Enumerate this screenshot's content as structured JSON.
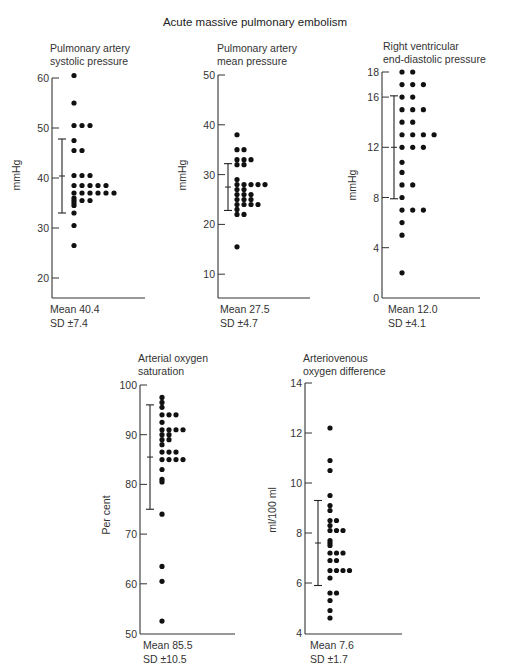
{
  "title": "Acute massive pulmonary embolism",
  "chart_data": [
    {
      "type": "scatter",
      "subtype": "dot-strip",
      "title": "Pulmonary artery systolic pressure",
      "title_lines": [
        "Pulmonary artery",
        "systolic pressure"
      ],
      "ylabel": "mmHg",
      "yticks": [
        20,
        30,
        40,
        50,
        60
      ],
      "ylim": [
        15.5,
        60
      ],
      "values": [
        60.5,
        55,
        50.5,
        50.5,
        50.5,
        47.5,
        45.5,
        45.5,
        40.5,
        40.5,
        40.5,
        38.5,
        38.5,
        38.5,
        38.5,
        38.5,
        37,
        37,
        37,
        37,
        37,
        37,
        36,
        35.5,
        35.5,
        35.5,
        35,
        34.5,
        33,
        30.5,
        26.5
      ],
      "mean": 40.4,
      "sd": 7.4,
      "mean_label": "Mean 40.4",
      "sd_label": "SD ±7.4"
    },
    {
      "type": "scatter",
      "subtype": "dot-strip",
      "title": "Pulmonary artery mean pressure",
      "title_lines": [
        "Pulmonary artery",
        "mean pressure"
      ],
      "ylabel": "mmHg",
      "yticks": [
        10,
        20,
        30,
        40,
        50
      ],
      "ylim": [
        5,
        50
      ],
      "values": [
        38,
        35,
        35,
        33,
        33,
        33,
        32,
        32,
        29,
        28,
        28,
        28,
        28,
        28,
        27,
        27,
        26,
        26,
        26,
        25,
        25,
        25,
        24,
        24,
        24,
        24,
        23,
        22,
        22,
        15.5
      ],
      "mean": 27.5,
      "sd": 4.7,
      "mean_label": "Mean 27.5",
      "sd_label": "SD ±4.7"
    },
    {
      "type": "scatter",
      "subtype": "dot-strip",
      "title": "Right ventricular end-diastolic pressure",
      "title_lines": [
        "Right ventricular",
        "end-diastolic pressure"
      ],
      "ylabel": "mmHg",
      "yticks": [
        0,
        4,
        8,
        12,
        16,
        18
      ],
      "ylim": [
        0,
        18
      ],
      "values": [
        18,
        18,
        17,
        17,
        17,
        16,
        16,
        15,
        15,
        15,
        14,
        14,
        13,
        13,
        13,
        13,
        12,
        12,
        12,
        10.8,
        10,
        9,
        9,
        8,
        7,
        7,
        7,
        6,
        5,
        2
      ],
      "mean": 12.0,
      "sd": 4.1,
      "mean_label": "Mean 12.0",
      "sd_label": "SD ±4.1"
    },
    {
      "type": "scatter",
      "subtype": "dot-strip",
      "title": "Arterial oxygen saturation",
      "title_lines": [
        "Arterial oxygen",
        "saturation"
      ],
      "ylabel": "Per cent",
      "yticks": [
        50,
        60,
        70,
        80,
        90,
        100
      ],
      "ylim": [
        50,
        100
      ],
      "values": [
        97.5,
        96.5,
        95.5,
        94,
        94,
        94,
        92.5,
        91,
        91,
        91,
        91,
        90,
        90,
        89,
        89,
        88,
        86.5,
        86.5,
        86.5,
        85,
        85,
        85,
        85,
        83,
        81,
        80.5,
        74,
        63.5,
        60.5,
        52.5
      ],
      "mean": 85.5,
      "sd": 10.5,
      "mean_label": "Mean 85.5",
      "sd_label": "SD ±10.5"
    },
    {
      "type": "scatter",
      "subtype": "dot-strip",
      "title": "Arteriovenous oxygen difference",
      "title_lines": [
        "Arteriovenous",
        "oxygen difference"
      ],
      "ylabel": "ml/100 ml",
      "yticks": [
        4,
        6,
        8,
        10,
        12,
        14
      ],
      "ylim": [
        4,
        14
      ],
      "values": [
        12.2,
        10.9,
        10.5,
        9.5,
        9.1,
        8.9,
        8.5,
        8.5,
        8.3,
        8.1,
        8.1,
        8.1,
        7.7,
        7.6,
        7.5,
        7.2,
        7.2,
        7.2,
        6.9,
        6.9,
        6.5,
        6.5,
        6.5,
        6.5,
        6.2,
        5.6,
        5.6,
        5.3,
        4.9,
        4.6
      ],
      "mean": 7.6,
      "sd": 1.7,
      "mean_label": "Mean 7.6",
      "sd_label": "SD ±1.7"
    }
  ],
  "layout": [
    {
      "axis_x": 52,
      "x_end": 145,
      "y_top_val": 60,
      "y_top_px": 78,
      "px_per_unit": 5.0,
      "y_bottom_px": 298,
      "dot_x0": 74,
      "dot_dx": 8,
      "err_x": 62,
      "title_x": 50,
      "title_y": 42,
      "stat_x": 50,
      "stat_y": 302,
      "ylabel_x": 20,
      "ylabel_y": 175
    },
    {
      "axis_x": 218,
      "x_end": 310,
      "y_top_val": 50,
      "y_top_px": 75,
      "px_per_unit": 4.98,
      "y_bottom_px": 298,
      "dot_x0": 237,
      "dot_dx": 7,
      "err_x": 228,
      "title_x": 217,
      "title_y": 42,
      "stat_x": 220,
      "stat_y": 302,
      "ylabel_x": 186,
      "ylabel_y": 175
    },
    {
      "axis_x": 382,
      "x_end": 480,
      "y_top_val": 18,
      "y_top_px": 72,
      "px_per_unit": 12.55,
      "y_bottom_px": 298,
      "dot_x0": 402,
      "dot_dx": 10.7,
      "err_x": 394,
      "title_x": 383,
      "title_y": 40,
      "stat_x": 388,
      "stat_y": 302,
      "ylabel_x": 356,
      "ylabel_y": 185
    },
    {
      "axis_x": 140,
      "x_end": 235,
      "y_top_val": 100,
      "y_top_px": 385,
      "px_per_unit": 4.97,
      "y_bottom_px": 634,
      "dot_x0": 162,
      "dot_dx": 7,
      "err_x": 150,
      "title_x": 138,
      "title_y": 352,
      "stat_x": 143,
      "stat_y": 638,
      "ylabel_x": 110,
      "ylabel_y": 515
    },
    {
      "axis_x": 305,
      "x_end": 402,
      "y_top_val": 14,
      "y_top_px": 383,
      "px_per_unit": 25.0,
      "y_bottom_px": 634,
      "dot_x0": 330,
      "dot_dx": 6.5,
      "err_x": 318,
      "title_x": 303,
      "title_y": 352,
      "stat_x": 310,
      "stat_y": 638,
      "ylabel_x": 276,
      "ylabel_y": 510
    }
  ]
}
